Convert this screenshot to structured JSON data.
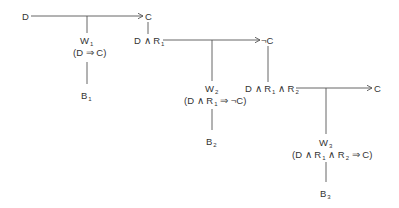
{
  "diagram": {
    "colors": {
      "line": "#555555",
      "text": "#333333",
      "background": "#ffffff"
    },
    "nodes": {
      "start": {
        "label": "D"
      },
      "c1": {
        "label": "C"
      },
      "n1": {
        "base": "D ∧ R",
        "sub": "1"
      },
      "c2": {
        "label": "¬C"
      },
      "n2": {
        "a": "D ∧ R",
        "sub1": "1",
        "b": " ∧ R",
        "sub2": "2"
      },
      "c3": {
        "label": "C"
      }
    },
    "warrants": [
      {
        "w": "W",
        "wsub": "1",
        "rule": "(D ⇒ C)",
        "b": "B",
        "bsub": "1"
      },
      {
        "w": "W",
        "wsub": "2",
        "rule_a": "(D ∧ R",
        "rule_sub1": "1",
        "rule_b": " ⇒ ¬C)",
        "b": "B",
        "bsub": "2"
      },
      {
        "w": "W",
        "wsub": "3",
        "rule_a": "(D ∧ R",
        "rule_sub1": "1",
        "rule_b": " ∧ R",
        "rule_sub2": "2",
        "rule_c": " ⇒ C)",
        "b": "B",
        "bsub": "3"
      }
    ]
  }
}
